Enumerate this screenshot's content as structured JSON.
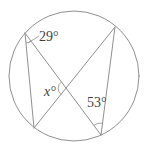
{
  "figure": {
    "angle_labels": {
      "top_left": "29°",
      "center": "x°",
      "bottom_right": "53°"
    },
    "angle_values": {
      "top_left_deg": 29,
      "bottom_right_deg": 53,
      "center_unknown": "x"
    },
    "colors": {
      "line": "#8f8f8f",
      "text": "#3f3f3f",
      "background": "#ffffff"
    }
  }
}
